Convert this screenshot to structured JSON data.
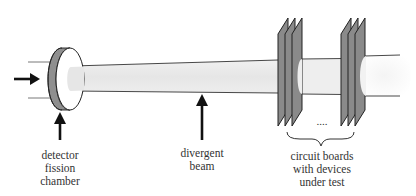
{
  "diagram": {
    "colors": {
      "background": "#ffffff",
      "outline": "#222222",
      "detector_rim": "#8f8f8f",
      "board_fill": "#8a8a8a",
      "beam_fill": "#e8e8e8",
      "text": "#333333"
    },
    "components": [
      {
        "id": "incoming-beam",
        "type": "arrow",
        "direction": "right"
      },
      {
        "id": "detector",
        "type": "disc",
        "label_ref": "labels.detector"
      },
      {
        "id": "beam",
        "type": "divergent-cylinder",
        "label_ref": "labels.beam"
      },
      {
        "id": "board-group-1",
        "type": "board-stack",
        "count": 3
      },
      {
        "id": "board-group-2",
        "type": "board-stack",
        "count": 3
      },
      {
        "id": "ellipsis",
        "type": "text",
        "value": "...."
      },
      {
        "id": "brace",
        "type": "curly-brace",
        "label_ref": "labels.boards"
      }
    ],
    "connections": [
      {
        "from": "incoming-beam",
        "to": "detector"
      },
      {
        "from": "detector",
        "to": "beam"
      },
      {
        "from": "beam",
        "to": "board-group-1"
      },
      {
        "from": "board-group-1",
        "to": "board-group-2"
      }
    ]
  },
  "labels": {
    "detector": {
      "lines": [
        "detector",
        "fission",
        "chamber"
      ]
    },
    "beam": {
      "lines": [
        "divergent",
        "beam"
      ]
    },
    "boards": {
      "lines": [
        "circuit boards",
        "with devices",
        "under test"
      ]
    },
    "ellipsis": "...."
  }
}
